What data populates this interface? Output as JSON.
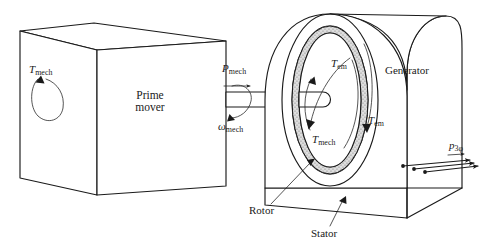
{
  "figure": {
    "background_color": "#ffffff",
    "line_color": "#1a1a1a",
    "gap_fill_color": "#d6d6d6"
  },
  "prime_mover": {
    "label_line1": "Prime",
    "label_line2": "mover",
    "torque_symbol": "T",
    "torque_subscript": "mech"
  },
  "shaft": {
    "power_symbol": "P",
    "power_subscript": "mech",
    "speed_symbol": "ω",
    "speed_subscript": "mech"
  },
  "generator": {
    "label": "Generator",
    "em_torque_symbol": "T",
    "em_torque_subscript": "em",
    "mech_torque_symbol": "T",
    "mech_torque_subscript": "mech",
    "rotor_label": "Rotor",
    "stator_label": "Stator"
  },
  "output": {
    "power_symbol": "p",
    "power_subscript": "3φ",
    "wire_count": 3
  }
}
